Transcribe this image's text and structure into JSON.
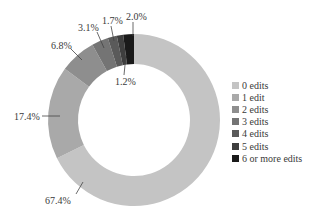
{
  "chart_data": {
    "type": "pie",
    "subtype": "donut",
    "title": "",
    "start_angle": "12 o'clock, clockwise",
    "categories": [
      "0 edits",
      "1 edit",
      "2 edits",
      "3 edits",
      "4 edits",
      "5 edits",
      "6 or more edits"
    ],
    "values": [
      67.4,
      17.4,
      6.8,
      3.1,
      1.7,
      1.2,
      2.0
    ],
    "value_labels": [
      "67.4%",
      "17.4%",
      "6.8%",
      "3.1%",
      "1.7%",
      "1.2%",
      "2.0%"
    ],
    "colors": [
      "#c4c4c4",
      "#a9a9a9",
      "#8e8e8e",
      "#747474",
      "#5a5a5a",
      "#3e3e3e",
      "#1a1a1a"
    ],
    "legend_position": "right"
  },
  "legend": {
    "items": [
      {
        "label": "0 edits",
        "color": "#c4c4c4"
      },
      {
        "label": "1 edit",
        "color": "#a9a9a9"
      },
      {
        "label": "2 edits",
        "color": "#8e8e8e"
      },
      {
        "label": "3 edits",
        "color": "#747474"
      },
      {
        "label": "4 edits",
        "color": "#5a5a5a"
      },
      {
        "label": "5 edits",
        "color": "#3e3e3e"
      },
      {
        "label": "6 or more edits",
        "color": "#1a1a1a"
      }
    ]
  },
  "labels": {
    "l0": "67.4%",
    "l1": "17.4%",
    "l2": "6.8%",
    "l3": "3.1%",
    "l4": "1.7%",
    "l5": "1.2%",
    "l6": "2.0%"
  }
}
